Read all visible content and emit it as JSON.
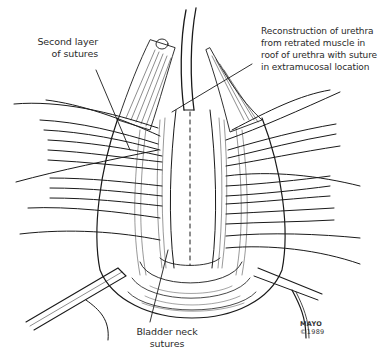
{
  "figure": {
    "style": "black-and-white surgical line drawing"
  },
  "labels": {
    "second_layer": [
      "Second layer",
      "of sutures"
    ],
    "reconstruction": [
      "Reconstruction of urethra",
      "from retrated muscle in",
      "roof of urethra with suture",
      "in extramucosal location"
    ],
    "bladder_neck": [
      "Bladder neck",
      "sutures"
    ],
    "credit": [
      "MAYO",
      "©1989"
    ]
  },
  "colors": {
    "ink": "#1a1a1a",
    "background": "#ffffff"
  }
}
